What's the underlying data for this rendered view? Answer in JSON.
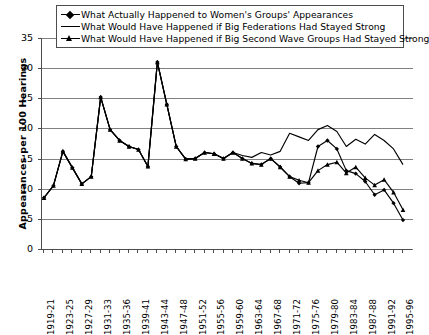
{
  "chart_data": {
    "type": "line",
    "title": "",
    "xlabel": "",
    "ylabel": "Appearances per 100 Hearings",
    "ylim": [
      0,
      35
    ],
    "yticks": [
      0,
      5,
      10,
      15,
      20,
      25,
      30,
      35
    ],
    "grid": true,
    "legend_position": "top",
    "x": [
      "1919-21",
      "1921-22",
      "1923-25",
      "1925-26",
      "1927-29",
      "1929-30",
      "1931-33",
      "1933-34",
      "1935-36",
      "1937-38",
      "1939-41",
      "1941-42",
      "1943-44",
      "1945-46",
      "1947-48",
      "1949-50",
      "1951-52",
      "1953-54",
      "1955-56",
      "1957-58",
      "1959-60",
      "1961-62",
      "1963-64",
      "1965-66",
      "1967-68",
      "1969-70",
      "1971-72",
      "1973-74",
      "1975-76",
      "1977-78",
      "1979-80",
      "1981-82",
      "1983-84",
      "1985-86",
      "1987-88",
      "1989-90",
      "1991-92",
      "1993-94",
      "1995-96"
    ],
    "tick_labels": [
      "1919-21",
      "",
      "1923-25",
      "",
      "1927-29",
      "",
      "1931-33",
      "",
      "1935-36",
      "",
      "1939-41",
      "",
      "1943-44",
      "",
      "1947-48",
      "",
      "1951-52",
      "",
      "1955-56",
      "",
      "1959-60",
      "",
      "1963-64",
      "",
      "1967-68",
      "",
      "1971-72",
      "",
      "1975-76",
      "",
      "1979-80",
      "",
      "1983-84",
      "",
      "1987-88",
      "",
      "1991-92",
      "",
      "1995-96"
    ],
    "series": [
      {
        "name": "What Actually Happened to Women's Groups' Appearances",
        "marker": "diamond",
        "color": "#000000",
        "values": [
          8.5,
          10.5,
          16.2,
          13.5,
          10.8,
          12.0,
          25.2,
          19.8,
          18.0,
          17.0,
          16.5,
          13.7,
          31.0,
          24.0,
          17.0,
          14.9,
          15.0,
          16.0,
          15.8,
          15.0,
          16.0,
          15.0,
          14.2,
          14.0,
          15.0,
          13.6,
          12.0,
          10.9,
          11.0,
          17.0,
          18.0,
          16.6,
          13.0,
          12.5,
          11.2,
          9.0,
          9.8,
          7.6,
          4.8
        ]
      },
      {
        "name": "What Would Have Happened if Big Federations Had Stayed Strong",
        "marker": "none",
        "color": "#000000",
        "values": [
          8.5,
          10.5,
          16.2,
          13.5,
          10.8,
          12.0,
          25.2,
          19.8,
          18.0,
          17.0,
          16.5,
          13.7,
          31.0,
          24.0,
          17.0,
          14.9,
          15.0,
          16.0,
          15.8,
          15.0,
          16.0,
          15.5,
          15.2,
          16.0,
          15.6,
          16.2,
          19.2,
          18.6,
          18.0,
          19.8,
          20.5,
          19.5,
          17.0,
          18.2,
          17.4,
          19.0,
          18.0,
          16.6,
          14.0
        ]
      },
      {
        "name": "What Would Have Happened if Big Second Wave Groups Had Stayed Strong",
        "marker": "triangle",
        "color": "#000000",
        "values": [
          8.5,
          10.5,
          16.2,
          13.5,
          10.8,
          12.0,
          25.2,
          19.8,
          18.0,
          17.0,
          16.5,
          13.7,
          31.0,
          24.0,
          17.0,
          14.9,
          15.0,
          16.0,
          15.8,
          15.0,
          16.0,
          15.0,
          14.2,
          14.0,
          15.0,
          13.6,
          12.0,
          11.4,
          11.0,
          13.0,
          14.0,
          14.4,
          12.6,
          13.6,
          11.8,
          10.6,
          11.5,
          9.4,
          6.5
        ]
      }
    ],
    "legend": [
      "What Actually Happened to Women's Groups' Appearances",
      "What Would Have Happened if Big Federations Had Stayed Strong",
      "What Would Have Happened if Big Second Wave Groups Had Stayed Strong"
    ]
  }
}
